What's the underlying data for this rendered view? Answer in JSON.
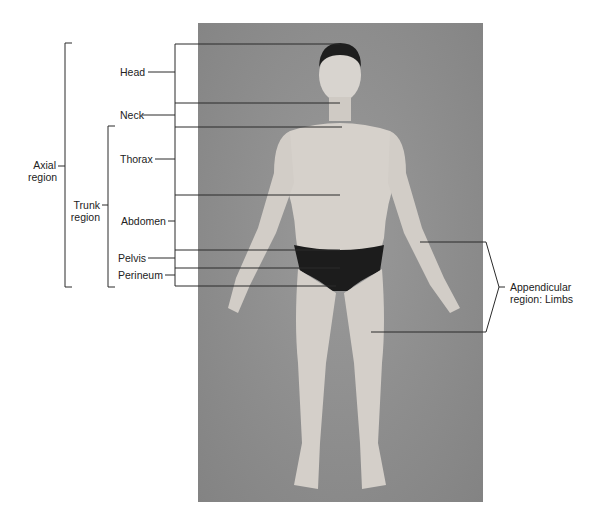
{
  "figure": {
    "photo_description": "Anterior view of a standing male figure in anatomical position",
    "background_color": "#8e8e8e",
    "line_color": "#2a2a2a"
  },
  "labels": {
    "axial_region": [
      "Axial",
      "region"
    ],
    "trunk_region": [
      "Trunk",
      "region"
    ],
    "head": "Head",
    "neck": "Neck",
    "thorax": "Thorax",
    "abdomen": "Abdomen",
    "pelvis": "Pelvis",
    "perineum": "Perineum",
    "appendicular_region": [
      "Appendicular",
      "region: Limbs"
    ]
  }
}
